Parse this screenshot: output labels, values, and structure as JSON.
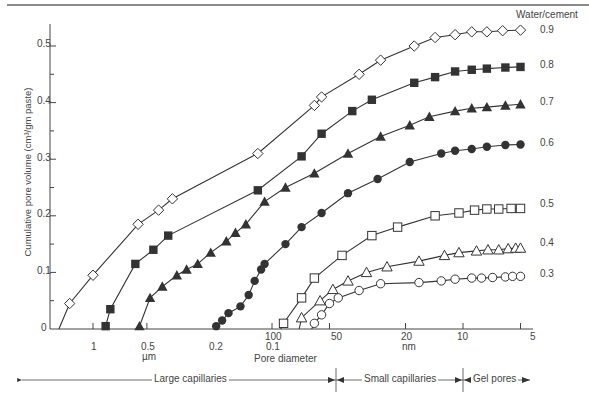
{
  "chart_data": {
    "type": "line",
    "title": "",
    "xlabel": "Pore diameter",
    "ylabel": "Cumulative pore volume (cm³/gm paste)",
    "legend_title": "Water/cement",
    "x_scale": "log (decreasing)",
    "x_ticks": [
      "1",
      "0.5",
      "0.2",
      "0.1 / 100",
      "50",
      "20",
      "10",
      "5"
    ],
    "x_units": [
      "µm",
      "nm"
    ],
    "ylim": [
      0,
      0.5
    ],
    "y_ticks": [
      "0",
      "0.1",
      "0.2",
      "0.3",
      "0.4",
      "0.5"
    ],
    "regions": [
      "Large capillaries",
      "Small capillaries",
      "Gel pores"
    ],
    "series": [
      {
        "name": "0.9",
        "marker": "open-diamond",
        "points_nm": [
          [
            1350,
            0.045
          ],
          [
            1000,
            0.095
          ],
          [
            560,
            0.185
          ],
          [
            430,
            0.21
          ],
          [
            360,
            0.23
          ],
          [
            120,
            0.31
          ],
          [
            60,
            0.395
          ],
          [
            55,
            0.41
          ],
          [
            35,
            0.45
          ],
          [
            27,
            0.475
          ],
          [
            18,
            0.5
          ],
          [
            14,
            0.515
          ],
          [
            11,
            0.52
          ],
          [
            9,
            0.525
          ],
          [
            7.5,
            0.525
          ],
          [
            6.2,
            0.527
          ],
          [
            5,
            0.528
          ]
        ]
      },
      {
        "name": "0.8",
        "marker": "filled-square",
        "points_nm": [
          [
            850,
            0.005
          ],
          [
            800,
            0.035
          ],
          [
            580,
            0.115
          ],
          [
            460,
            0.14
          ],
          [
            380,
            0.165
          ],
          [
            120,
            0.245
          ],
          [
            70,
            0.305
          ],
          [
            55,
            0.345
          ],
          [
            38,
            0.385
          ],
          [
            30,
            0.405
          ],
          [
            18,
            0.435
          ],
          [
            14,
            0.445
          ],
          [
            11,
            0.455
          ],
          [
            9,
            0.458
          ],
          [
            7.5,
            0.46
          ],
          [
            6,
            0.462
          ],
          [
            5,
            0.463
          ]
        ]
      },
      {
        "name": "0.7",
        "marker": "filled-triangle",
        "points_nm": [
          [
            550,
            0.005
          ],
          [
            480,
            0.055
          ],
          [
            410,
            0.075
          ],
          [
            340,
            0.095
          ],
          [
            300,
            0.105
          ],
          [
            260,
            0.115
          ],
          [
            220,
            0.135
          ],
          [
            180,
            0.155
          ],
          [
            160,
            0.17
          ],
          [
            140,
            0.185
          ],
          [
            110,
            0.225
          ],
          [
            85,
            0.25
          ],
          [
            60,
            0.275
          ],
          [
            40,
            0.31
          ],
          [
            27,
            0.34
          ],
          [
            19,
            0.36
          ],
          [
            15,
            0.375
          ],
          [
            11,
            0.385
          ],
          [
            9,
            0.39
          ],
          [
            7.5,
            0.392
          ],
          [
            6,
            0.395
          ],
          [
            5,
            0.397
          ]
        ]
      },
      {
        "name": "0.6",
        "marker": "filled-circle",
        "points_nm": [
          [
            205,
            0.005
          ],
          [
            190,
            0.015
          ],
          [
            175,
            0.028
          ],
          [
            150,
            0.04
          ],
          [
            135,
            0.06
          ],
          [
            125,
            0.085
          ],
          [
            115,
            0.105
          ],
          [
            110,
            0.115
          ],
          [
            85,
            0.15
          ],
          [
            70,
            0.18
          ],
          [
            55,
            0.205
          ],
          [
            40,
            0.24
          ],
          [
            28,
            0.265
          ],
          [
            19,
            0.295
          ],
          [
            13,
            0.31
          ],
          [
            11,
            0.315
          ],
          [
            9,
            0.318
          ],
          [
            7.5,
            0.322
          ],
          [
            6,
            0.325
          ],
          [
            5,
            0.326
          ]
        ]
      },
      {
        "name": "0.5",
        "marker": "open-square",
        "points_nm": [
          [
            87,
            0.01
          ],
          [
            70,
            0.055
          ],
          [
            60,
            0.09
          ],
          [
            43,
            0.13
          ],
          [
            30,
            0.165
          ],
          [
            22,
            0.18
          ],
          [
            14,
            0.2
          ],
          [
            10.5,
            0.205
          ],
          [
            8.7,
            0.21
          ],
          [
            7.5,
            0.212
          ],
          [
            6.5,
            0.212
          ],
          [
            5.6,
            0.213
          ],
          [
            5,
            0.213
          ]
        ]
      },
      {
        "name": "0.4",
        "marker": "open-triangle",
        "points_nm": [
          [
            70,
            0.02
          ],
          [
            56,
            0.05
          ],
          [
            48,
            0.07
          ],
          [
            40,
            0.085
          ],
          [
            32,
            0.1
          ],
          [
            25,
            0.11
          ],
          [
            17,
            0.12
          ],
          [
            12.5,
            0.13
          ],
          [
            10.5,
            0.135
          ],
          [
            8.5,
            0.138
          ],
          [
            7.4,
            0.14
          ],
          [
            6.5,
            0.14
          ],
          [
            5.8,
            0.142
          ],
          [
            5.3,
            0.143
          ],
          [
            5,
            0.143
          ]
        ]
      },
      {
        "name": "0.3",
        "marker": "open-circle",
        "points_nm": [
          [
            60,
            0.01
          ],
          [
            55,
            0.025
          ],
          [
            50,
            0.045
          ],
          [
            45,
            0.055
          ],
          [
            35,
            0.068
          ],
          [
            27,
            0.08
          ],
          [
            17,
            0.082
          ],
          [
            13,
            0.085
          ],
          [
            11,
            0.088
          ],
          [
            9,
            0.09
          ],
          [
            8,
            0.09
          ],
          [
            7,
            0.091
          ],
          [
            6,
            0.092
          ],
          [
            5.5,
            0.093
          ],
          [
            5,
            0.093
          ]
        ]
      }
    ]
  },
  "axes": {
    "ylabel": "Cumulative pore volume (cm³/gm paste)",
    "ytick_0": "0",
    "ytick_1": "0.1",
    "ytick_2": "0.2",
    "ytick_3": "0.3",
    "ytick_4": "0.4",
    "ytick_5": "0.5",
    "xtick_1": "1",
    "xtick_05": "0.5",
    "xtick_02": "0.2",
    "xtick_100": "100",
    "xtick_01": "0.1",
    "xtick_50": "50",
    "xtick_20": "20",
    "xtick_10": "10",
    "xtick_5": "5",
    "unit_um": "µm",
    "unit_nm": "nm",
    "xlabel": "Pore diameter"
  },
  "legend": {
    "title": "Water/cement",
    "s09": "0.9",
    "s08": "0.8",
    "s07": "0.7",
    "s06": "0.6",
    "s05": "0.5",
    "s04": "0.4",
    "s03": "0.3"
  },
  "regions": {
    "large": "Large capillaries",
    "small": "Small capillaries",
    "gel": "Gel pores"
  },
  "colors": {
    "line": "#333333",
    "axis": "#444444"
  }
}
